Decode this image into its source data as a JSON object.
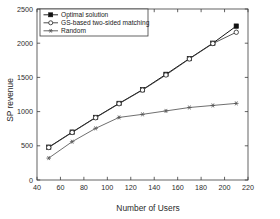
{
  "chart_data": {
    "type": "line",
    "title": "",
    "xlabel": "Number of Users",
    "ylabel": "SP revenue",
    "xlim": [
      40,
      220
    ],
    "ylim": [
      0,
      2500
    ],
    "xticks": [
      40,
      60,
      80,
      100,
      120,
      140,
      160,
      180,
      200,
      220
    ],
    "yticks": [
      0,
      500,
      1000,
      1500,
      2000,
      2500
    ],
    "grid": false,
    "legend_position": "upper-left",
    "x": [
      50,
      70,
      90,
      110,
      130,
      150,
      170,
      190,
      210
    ],
    "series": [
      {
        "name": "Optimal solution",
        "marker": "asterisk-filled-square",
        "color": "#111111",
        "values": [
          480,
          700,
          915,
          1120,
          1320,
          1545,
          1775,
          2000,
          2250
        ]
      },
      {
        "name": "GS-based two-sided matching",
        "marker": "circle-open",
        "color": "#3a3a3a",
        "values": [
          475,
          695,
          910,
          1115,
          1315,
          1535,
          1770,
          1995,
          2160
        ]
      },
      {
        "name": "Random",
        "marker": "asterisk",
        "color": "#555555",
        "values": [
          320,
          560,
          755,
          915,
          960,
          1010,
          1060,
          1090,
          1120
        ]
      }
    ]
  },
  "axes": {
    "x_title": "Number of Users",
    "y_title": "SP revenue",
    "x_tick_labels": [
      "40",
      "60",
      "80",
      "100",
      "120",
      "140",
      "160",
      "180",
      "200",
      "220"
    ],
    "y_tick_labels": [
      "0",
      "500",
      "1000",
      "1500",
      "2000",
      "2500"
    ]
  },
  "legend": {
    "entries": [
      {
        "label": "Optimal solution"
      },
      {
        "label": "GS-based two-sided matching"
      },
      {
        "label": "Random"
      }
    ]
  }
}
